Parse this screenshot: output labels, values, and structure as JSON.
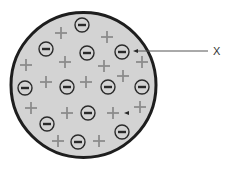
{
  "diagram": {
    "colors": {
      "background": "#ffffff",
      "sphere_fill": "#d3d3d3",
      "sphere_border": "#1e1e1e",
      "positive_charge": "#8c8c8c",
      "electron_stroke": "#2a2a2a",
      "electron_fill": "#d3d3d3",
      "leader_line": "#555555",
      "label_text": "#333333"
    },
    "sphere": {
      "cx": 83.5,
      "cy": 85,
      "r": 72.5,
      "stroke_width": 3
    },
    "electrons": [
      {
        "x": 82,
        "y": 25
      },
      {
        "x": 46,
        "y": 49
      },
      {
        "x": 87,
        "y": 53
      },
      {
        "x": 122,
        "y": 52
      },
      {
        "x": 25,
        "y": 88
      },
      {
        "x": 67,
        "y": 87
      },
      {
        "x": 108,
        "y": 87
      },
      {
        "x": 142,
        "y": 87
      },
      {
        "x": 88,
        "y": 113
      },
      {
        "x": 47,
        "y": 124
      },
      {
        "x": 122,
        "y": 132
      },
      {
        "x": 78,
        "y": 142
      }
    ],
    "electron_symbol": "−",
    "electron_radius": 7,
    "positive_charges": [
      {
        "x": 61,
        "y": 33
      },
      {
        "x": 107,
        "y": 37
      },
      {
        "x": 26,
        "y": 65
      },
      {
        "x": 65,
        "y": 62
      },
      {
        "x": 104,
        "y": 66
      },
      {
        "x": 142,
        "y": 62
      },
      {
        "x": 123,
        "y": 76
      },
      {
        "x": 46,
        "y": 82
      },
      {
        "x": 86,
        "y": 82
      },
      {
        "x": 31,
        "y": 108
      },
      {
        "x": 67,
        "y": 113
      },
      {
        "x": 113,
        "y": 113
      },
      {
        "x": 140,
        "y": 107
      },
      {
        "x": 58,
        "y": 141
      },
      {
        "x": 99,
        "y": 141
      }
    ],
    "positive_symbol": "+",
    "positive_half_size": 6,
    "small_arrowhead": {
      "x": 127,
      "y": 113
    },
    "label": {
      "text": "X",
      "x": 213,
      "y": 46,
      "leader": {
        "x1": 133,
        "y1": 51,
        "x2": 208,
        "y2": 51
      }
    }
  }
}
